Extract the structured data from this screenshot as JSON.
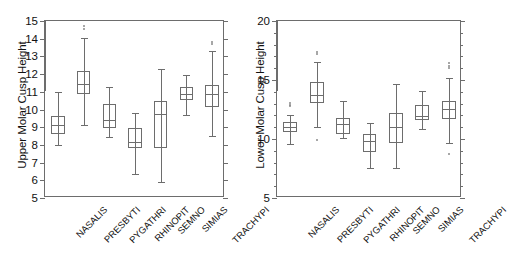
{
  "figure": {
    "name": "paired-boxplot-figure",
    "background": "#ffffff",
    "line_color": "#6d6d6d",
    "text_color": "#111111"
  },
  "chart_data": [
    {
      "id": "upper",
      "type": "box",
      "title": "",
      "ylabel": "Upper Molar Cusp Height",
      "xlabel": "",
      "ylim": [
        5,
        15
      ],
      "yticks": [
        5,
        6,
        7,
        8,
        9,
        10,
        11,
        12,
        13,
        14,
        15
      ],
      "ytick_labels": [
        "5",
        "6",
        "7",
        "8",
        "9",
        "10",
        "11",
        "12",
        "13",
        "14",
        "15"
      ],
      "grid": false,
      "legend": false,
      "categories": [
        "NASALIS",
        "PRESBYTI",
        "PYGATHRI",
        "RHINOPIT",
        "SEMNO",
        "SIMIAS",
        "TRACHYPI"
      ],
      "boxes": [
        {
          "category": "NASALIS",
          "whisker_low": 7.98,
          "q1": 8.62,
          "median": 9.1,
          "q3": 9.62,
          "whisker_high": 10.97,
          "outliers": []
        },
        {
          "category": "PRESBYTI",
          "whisker_low": 9.15,
          "q1": 10.85,
          "median": 11.45,
          "q3": 12.17,
          "whisker_high": 14.02,
          "outliers": [
            14.55,
            14.7
          ]
        },
        {
          "category": "PYGATHRI",
          "whisker_low": 8.42,
          "q1": 8.98,
          "median": 9.38,
          "q3": 10.3,
          "whisker_high": 11.28,
          "outliers": []
        },
        {
          "category": "RHINOPIT",
          "whisker_low": 6.38,
          "q1": 7.83,
          "median": 8.18,
          "q3": 8.97,
          "whisker_high": 9.8,
          "outliers": []
        },
        {
          "category": "SEMNO",
          "whisker_low": 5.9,
          "q1": 7.82,
          "median": 9.72,
          "q3": 10.47,
          "whisker_high": 12.28,
          "outliers": []
        },
        {
          "category": "SIMIAS",
          "whisker_low": 9.68,
          "q1": 10.52,
          "median": 10.88,
          "q3": 11.25,
          "whisker_high": 11.95,
          "outliers": []
        },
        {
          "category": "TRACHYPI",
          "whisker_low": 8.48,
          "q1": 10.12,
          "median": 10.85,
          "q3": 11.38,
          "whisker_high": 13.28,
          "outliers": [
            13.72,
            13.82
          ]
        }
      ]
    },
    {
      "id": "lower",
      "type": "box",
      "title": "",
      "ylabel": "Lower Molar Cusp Height",
      "xlabel": "",
      "ylim": [
        5,
        20
      ],
      "yticks": [
        5,
        10,
        15,
        20
      ],
      "ytick_labels": [
        "5",
        "10",
        "15",
        "20"
      ],
      "minor_ytick_step": 1,
      "grid": false,
      "legend": false,
      "categories": [
        "NASALIS",
        "PRESBYTI",
        "PYGATHRI",
        "RHINOPIT",
        "SEMNO",
        "SIMIAS",
        "TRACHYPI"
      ],
      "boxes": [
        {
          "category": "NASALIS",
          "whisker_low": 9.55,
          "q1": 10.55,
          "median": 11.0,
          "q3": 11.4,
          "whisker_high": 12.05,
          "outliers": [
            12.78,
            12.92,
            13.05
          ]
        },
        {
          "category": "PRESBYTI",
          "whisker_low": 11.02,
          "q1": 13.05,
          "median": 13.75,
          "q3": 14.82,
          "whisker_high": 16.55,
          "outliers": [
            17.18,
            17.35,
            9.92
          ]
        },
        {
          "category": "PYGATHRI",
          "whisker_low": 10.05,
          "q1": 10.42,
          "median": 11.25,
          "q3": 11.82,
          "whisker_high": 13.18,
          "outliers": []
        },
        {
          "category": "RHINOPIT",
          "whisker_low": 7.58,
          "q1": 8.92,
          "median": 9.82,
          "q3": 10.42,
          "whisker_high": 11.35,
          "outliers": []
        },
        {
          "category": "SEMNO",
          "whisker_low": 7.52,
          "q1": 9.62,
          "median": 11.05,
          "q3": 12.22,
          "whisker_high": 14.62,
          "outliers": []
        },
        {
          "category": "SIMIAS",
          "whisker_low": 10.88,
          "q1": 11.62,
          "median": 11.95,
          "q3": 12.88,
          "whisker_high": 14.05,
          "outliers": []
        },
        {
          "category": "TRACHYPI",
          "whisker_low": 9.62,
          "q1": 11.72,
          "median": 12.55,
          "q3": 13.18,
          "whisker_high": 15.18,
          "outliers": [
            16.05,
            16.22,
            16.4,
            8.7
          ]
        }
      ]
    }
  ]
}
